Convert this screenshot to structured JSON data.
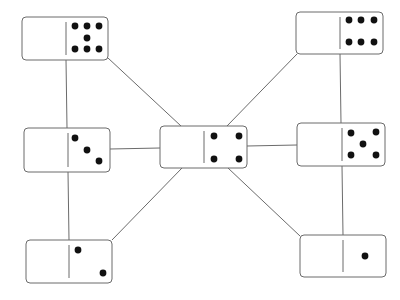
{
  "diagram": {
    "colors": {
      "background": "#ffffff",
      "border": "#6b6b6b",
      "line": "#6b6b6b",
      "pip": "#111111"
    },
    "dominoes": [
      {
        "id": "top-left",
        "left": 0,
        "right": 7,
        "x": 22,
        "y": 17,
        "w": 86,
        "h": 43
      },
      {
        "id": "top-right",
        "left": 0,
        "right": 6,
        "x": 296,
        "y": 12,
        "w": 87,
        "h": 42
      },
      {
        "id": "middle-left",
        "left": 0,
        "right": 3,
        "x": 24,
        "y": 128,
        "w": 86,
        "h": 44
      },
      {
        "id": "center",
        "left": 0,
        "right": 4,
        "x": 160,
        "y": 126,
        "w": 87,
        "h": 42
      },
      {
        "id": "middle-right",
        "left": 0,
        "right": 5,
        "x": 297,
        "y": 123,
        "w": 88,
        "h": 43
      },
      {
        "id": "bottom-left",
        "left": 0,
        "right": 2,
        "x": 26,
        "y": 240,
        "w": 86,
        "h": 43
      },
      {
        "id": "bottom-right",
        "left": 0,
        "right": 1,
        "x": 300,
        "y": 235,
        "w": 86,
        "h": 42
      }
    ],
    "connections": [
      [
        "top-left",
        "middle-left"
      ],
      [
        "middle-left",
        "bottom-left"
      ],
      [
        "top-right",
        "middle-right"
      ],
      [
        "middle-right",
        "bottom-right"
      ],
      [
        "middle-left",
        "center"
      ],
      [
        "center",
        "middle-right"
      ],
      [
        "top-left",
        "center"
      ],
      [
        "top-right",
        "center"
      ],
      [
        "bottom-left",
        "center"
      ],
      [
        "bottom-right",
        "center"
      ]
    ]
  }
}
